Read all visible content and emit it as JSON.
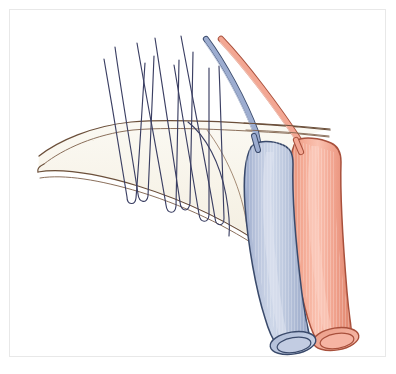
{
  "figure": {
    "title": "Surgical anastomosis illustration: two cannulated vessels with suture array through tissue band",
    "caption": "",
    "background_color": "#ffffff",
    "frame_color": "#e8e8e8",
    "frame": {
      "x": 9,
      "y": 9,
      "width": 377,
      "height": 348
    }
  },
  "palette": {
    "vein_fill": "#b4c0da",
    "vein_fill_light": "#ccd5e6",
    "vein_fill_dark": "#94a3c4",
    "vein_outline": "#3a4a6b",
    "vein_lumen": "#c4cee3",
    "artery_fill": "#f0a28f",
    "artery_fill_light": "#f8c3b4",
    "artery_fill_dark": "#e08670",
    "artery_outline": "#a8503c",
    "artery_lumen": "#f4b0a0",
    "band_fill": "#f9f6ed",
    "band_outline": "#6b4f3a",
    "band_striation": "#ded3bf",
    "suture_color": "#3b3f63",
    "cannula_blue_fill": "#97a8cc",
    "cannula_blue_outline": "#3a4a6b",
    "cannula_red_fill": "#f3a793",
    "cannula_red_outline": "#a8503c"
  },
  "elements": {
    "vein_tube": {
      "name": "Vein (blue vessel)",
      "color": "#b4c0da",
      "lumen_visible": true
    },
    "artery_tube": {
      "name": "Artery (red vessel)",
      "color": "#f0a28f",
      "lumen_visible": true
    },
    "cannula_blue": {
      "name": "Blue cannula / catheter",
      "color": "#97a8cc"
    },
    "cannula_red": {
      "name": "Red cannula / catheter",
      "color": "#f3a793"
    },
    "tissue_band": {
      "name": "Tissue band / mesenteric fold",
      "color": "#f9f6ed"
    },
    "suture_array": {
      "name": "Suture threads",
      "color": "#3b3f63",
      "count": 6
    }
  },
  "geometry": {
    "sutures": [
      {
        "id": "suture-1",
        "top": [
          104,
          59
        ],
        "bottom": [
          131,
          208
        ],
        "loop_width": 9,
        "loop_depth": 11
      },
      {
        "id": "suture-2",
        "top": [
          115,
          47
        ],
        "bottom": [
          141,
          206
        ],
        "loop_width": 9,
        "loop_depth": 11
      },
      {
        "id": "suture-3",
        "top": [
          137,
          43
        ],
        "bottom": [
          168,
          216
        ],
        "loop_width": 9,
        "loop_depth": 11
      },
      {
        "id": "suture-4",
        "top": [
          155,
          38
        ],
        "bottom": [
          180,
          214
        ],
        "loop_width": 9,
        "loop_depth": 11
      },
      {
        "id": "suture-5",
        "top": [
          174,
          65
        ],
        "bottom": [
          196,
          224
        ],
        "loop_width": 9,
        "loop_depth": 11
      },
      {
        "id": "suture-6",
        "top": [
          181,
          36
        ],
        "bottom": [
          213,
          229
        ],
        "loop_width": 9,
        "loop_depth": 11
      }
    ],
    "band": {
      "top_edge": "M 37,153 C 55,138 90,124 130,120 C 175,116 245,121 300,125 L 332,128",
      "bottom_edge": "M 38,172 C 60,164 95,170 135,182 C 185,197 230,219 262,241 L 272,250"
    },
    "vein_tube_path": {
      "left": "M 247,146 C 243,180 250,240 262,286 C 268,312 273,326 277,336",
      "right": "M 290,140 C 288,176 292,240 300,288 C 304,314 308,328 311,338"
    },
    "artery_tube_path": {
      "left": "M 293,140 C 291,178 296,242 305,290 C 310,316 314,328 317,338",
      "right": "M 334,152 C 333,186 337,246 345,292 C 349,316 352,326 355,334"
    },
    "cannula_blue_path": "M 206,38 C 222,60 243,98 256,130 L 259,146",
    "cannula_red_path": "M 220,38 C 243,62 276,106 297,138 L 302,148"
  }
}
